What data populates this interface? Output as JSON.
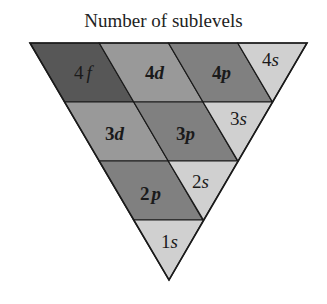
{
  "title": "Number of sublevels",
  "colors": {
    "f": "#575757",
    "d": "#999999",
    "p": "#808080",
    "s": "#d0d0d0",
    "stroke": "#1a1a1a"
  },
  "rows": [
    {
      "shell": 4,
      "cells": [
        {
          "label_num": "4",
          "label_letter": "f",
          "type": "f"
        },
        {
          "label_num": "4",
          "label_letter": "d",
          "type": "d"
        },
        {
          "label_num": "4",
          "label_letter": "p",
          "type": "p"
        },
        {
          "label_num": "4",
          "label_letter": "s",
          "type": "s"
        }
      ]
    },
    {
      "shell": 3,
      "cells": [
        {
          "label_num": "3",
          "label_letter": "d",
          "type": "d"
        },
        {
          "label_num": "3",
          "label_letter": "p",
          "type": "p"
        },
        {
          "label_num": "3",
          "label_letter": "s",
          "type": "s"
        }
      ]
    },
    {
      "shell": 2,
      "cells": [
        {
          "label_num": "2",
          "label_letter": "p",
          "type": "p"
        },
        {
          "label_num": "2",
          "label_letter": "s",
          "type": "s"
        }
      ]
    },
    {
      "shell": 1,
      "cells": [
        {
          "label_num": "1",
          "label_letter": "s",
          "type": "s"
        }
      ]
    }
  ]
}
